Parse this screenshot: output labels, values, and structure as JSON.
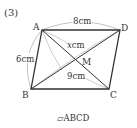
{
  "problem": {
    "number": "(3)",
    "caption_symbol": "▱",
    "caption_name": "ABCD"
  },
  "vertices": {
    "A": {
      "label": "A",
      "x": 42,
      "y": 30
    },
    "B": {
      "label": "B",
      "x": 31,
      "y": 89
    },
    "C": {
      "label": "C",
      "x": 109,
      "y": 89
    },
    "D": {
      "label": "D",
      "x": 120,
      "y": 30
    },
    "M": {
      "label": "M"
    }
  },
  "measurements": {
    "AD": {
      "value": "8cm"
    },
    "AB": {
      "value": "6cm"
    },
    "BD_part": {
      "var": "x",
      "unit": "cm"
    },
    "AC": {
      "value": "9cm"
    }
  },
  "colors": {
    "stroke": "#333333",
    "arc": "#999999"
  }
}
